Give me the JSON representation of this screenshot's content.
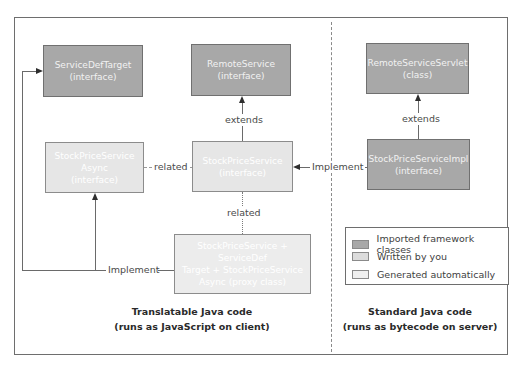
{
  "colors": {
    "imported": "#a8a8a8",
    "written": "#e6e6e6",
    "generated": "#ececec",
    "border": "#707070",
    "line": "#6a6a6a"
  },
  "boxes": {
    "service_def_target": {
      "name": "ServiceDefTarget",
      "kind": "(interface)",
      "category": "imported"
    },
    "remote_service": {
      "name": "RemoteService",
      "kind": "(interface)",
      "category": "imported"
    },
    "remote_service_servlet": {
      "name": "RemoteServiceServlet",
      "kind": "(class)",
      "category": "imported"
    },
    "stock_price_service_async": {
      "name": "StockPriceService",
      "name2": "Async",
      "kind": "(interface)",
      "category": "written"
    },
    "stock_price_service": {
      "name": "StockPriceService",
      "kind": "(interface)",
      "category": "written"
    },
    "stock_price_service_impl": {
      "name": "StockPriceServiceImpl",
      "kind": "(interface)",
      "category": "imported"
    },
    "proxy": {
      "line1": "StockPriceService + ServiceDef",
      "line2": "Target + StockPriceService",
      "line3": "Async (proxy class)",
      "category": "generated"
    }
  },
  "edges": {
    "extends_left": "extends",
    "extends_right": "extends",
    "related_horizontal": "related",
    "related_vertical": "related",
    "implement_right": "Implement",
    "implement_left": "Implement"
  },
  "legend": {
    "items": [
      {
        "label": "Imported framework classes",
        "category": "imported"
      },
      {
        "label": "Written by you",
        "category": "written"
      },
      {
        "label": "Generated automatically",
        "category": "generated"
      }
    ]
  },
  "captions": {
    "client_line1": "Translatable Java code",
    "client_line2": "(runs as JavaScript on client)",
    "server_line1": "Standard Java code",
    "server_line2": "(runs as bytecode on server)"
  }
}
